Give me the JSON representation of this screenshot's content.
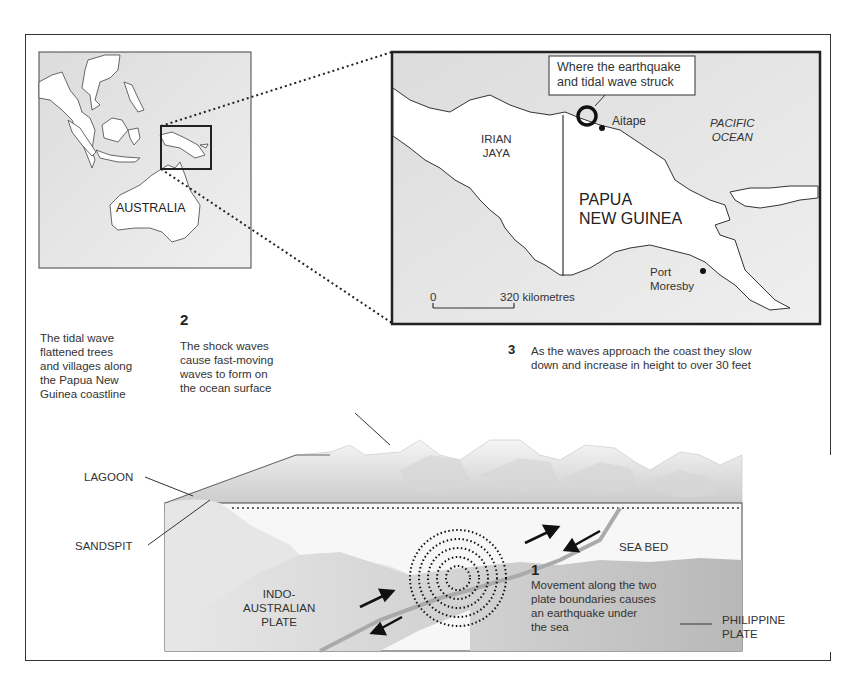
{
  "world_map": {
    "label_australia": "AUSTRALIA"
  },
  "inset_map": {
    "callout": [
      "Where the earthquake",
      "and tidal wave struck"
    ],
    "label_irian_jaya": [
      "IRIAN",
      "JAYA"
    ],
    "label_png": [
      "PAPUA",
      "NEW GUINEA"
    ],
    "label_aitape": "Aitape",
    "label_pacific": [
      "PACIFIC",
      "OCEAN"
    ],
    "label_port_moresby": [
      "Port",
      "Moresby"
    ],
    "scale_zero": "0",
    "scale_label": "320 kilometres"
  },
  "captions": {
    "left_text": [
      "The tidal wave",
      "flattened trees",
      "and villages along",
      "the Papua New",
      "Guinea coastline"
    ],
    "step2_number": "2",
    "step2_text": [
      "The shock waves",
      "cause fast-moving",
      "waves to form on",
      "the ocean surface"
    ],
    "step3_number": "3",
    "step3_text": [
      "As the waves approach the coast they slow",
      "down and increase in height to over 30 feet"
    ],
    "step1_number": "1",
    "step1_text": [
      "Movement along the two",
      "plate boundaries causes",
      "an earthquake under",
      "the sea"
    ]
  },
  "cross_section": {
    "label_lagoon": "LAGOON",
    "label_sandspit": "SANDSPIT",
    "label_indo": [
      "INDO-",
      "AUSTRALIAN",
      "PLATE"
    ],
    "label_seabed": "SEA BED",
    "label_philippine": [
      "PHILIPPINE",
      "PLATE"
    ]
  },
  "colors": {
    "map_bg": "#e8e8e8",
    "land": "#ffffff",
    "line": "#333333",
    "plate_light": "#e4e4e4",
    "plate_dark": "#c4c4c4"
  }
}
